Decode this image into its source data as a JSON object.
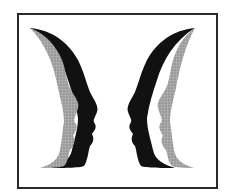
{
  "figure": {
    "colors": {
      "frame": "#2a2a2a",
      "background": "#ffffff",
      "dark_layer": "#111111",
      "gray_layer": "#9a9a9a"
    }
  }
}
